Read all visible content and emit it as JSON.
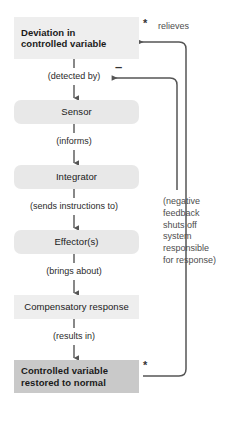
{
  "diagram": {
    "type": "flowchart",
    "colors": {
      "light_box": "#eeeeee",
      "round_box": "#e8e8e8",
      "dark_box": "#c9c9c9",
      "line": "#555555",
      "text": "#1a1a1a",
      "muted_text": "#4d4d4d",
      "background": "#ffffff"
    },
    "nodes": [
      {
        "id": "deviation",
        "label": "Deviation in\ncontrolled variable",
        "line1": "Deviation in",
        "line2": "controlled variable",
        "style": "light",
        "bold": true
      },
      {
        "id": "sensor",
        "label": "Sensor",
        "style": "rounded",
        "bold": false
      },
      {
        "id": "integrator",
        "label": "Integrator",
        "style": "rounded",
        "bold": false
      },
      {
        "id": "effector",
        "label": "Effector(s)",
        "style": "rounded",
        "bold": false
      },
      {
        "id": "compensatory",
        "label": "Compensatory response",
        "style": "light",
        "bold": false
      },
      {
        "id": "restored",
        "label": "Controlled variable\nrestored to normal",
        "line1": "Controlled variable",
        "line2": "restored to normal",
        "style": "dark",
        "bold": true
      }
    ],
    "connectors": [
      {
        "id": "c1",
        "from": "deviation",
        "to": "sensor",
        "label": "(detected by)"
      },
      {
        "id": "c2",
        "from": "sensor",
        "to": "integrator",
        "label": "(informs)"
      },
      {
        "id": "c3",
        "from": "integrator",
        "to": "effector",
        "label": "(sends instructions to)"
      },
      {
        "id": "c4",
        "from": "effector",
        "to": "compensatory",
        "label": "(brings about)"
      },
      {
        "id": "c5",
        "from": "compensatory",
        "to": "restored",
        "label": "(results in)"
      }
    ],
    "feedback": {
      "relieves_label": "relieves",
      "minus_sign": "–",
      "asterisk": "*",
      "note_lines": [
        "(negative",
        "feedback",
        "shuts off",
        "system",
        "responsible",
        "for response)"
      ],
      "note_text": "(negative feedback shuts off system responsible for response)"
    }
  }
}
